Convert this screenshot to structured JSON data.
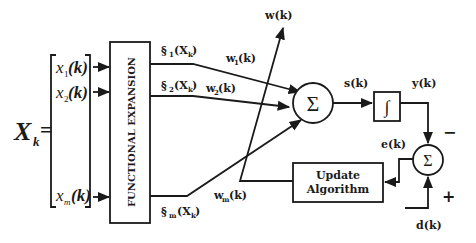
{
  "diagram": {
    "type": "block-diagram",
    "input_vector": {
      "label": "X",
      "label_sub": "k",
      "equals": "=",
      "elements": [
        {
          "name": "x",
          "sub": "1",
          "arg": "(k)"
        },
        {
          "name": "x",
          "sub": "2",
          "arg": "(k)"
        },
        {
          "name": "x",
          "sub": "m",
          "arg": "(k)"
        }
      ]
    },
    "expansion_block": {
      "label": "FUNCTIONAL EXPANSION"
    },
    "expanded_outputs": [
      {
        "sym": "§",
        "sub": "1",
        "arg": "(X",
        "arg_sub": "k",
        "close": ")"
      },
      {
        "sym": "§",
        "sub": "2",
        "arg": "(X",
        "arg_sub": "k",
        "close": ")"
      },
      {
        "sym": "§",
        "sub": "m",
        "arg": "(X",
        "arg_sub": "k",
        "close": ")"
      }
    ],
    "weights": [
      {
        "name": "w",
        "sub": "1",
        "arg": "(k)"
      },
      {
        "name": "w",
        "sub": "2",
        "arg": "(k)"
      },
      {
        "name": "w",
        "sub": "m",
        "arg": "(k)"
      }
    ],
    "weight_vector": {
      "label": "w(k)"
    },
    "summer": {
      "symbol": "Σ"
    },
    "summer_output": {
      "label": "s(k)"
    },
    "activation": {
      "symbol": "∫"
    },
    "output": {
      "label": "y(k)"
    },
    "error_summer": {
      "symbol": "Σ",
      "minus": "−",
      "plus": "+"
    },
    "error": {
      "label": "e(k)"
    },
    "desired": {
      "label": "d(k)"
    },
    "update_block": {
      "line1": "Update",
      "line2": "Algorithm"
    }
  }
}
